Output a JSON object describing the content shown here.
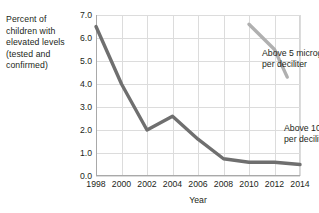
{
  "chart_data": {
    "type": "line",
    "title": "",
    "xlabel": "Year",
    "ylabel": "Percent of children with elevated levels (tested and confirmed)",
    "ylabel_lines": [
      "Percent of",
      "children with",
      "elevated levels",
      "(tested and",
      "confirmed)"
    ],
    "x": [
      1998,
      2000,
      2002,
      2004,
      2006,
      2008,
      2010,
      2012,
      2014
    ],
    "xlim": [
      1998,
      2014
    ],
    "ylim": [
      0.0,
      7.0
    ],
    "xtick_labels": [
      "1998",
      "2000",
      "2002",
      "2004",
      "2006",
      "2008",
      "2010",
      "2012",
      "2014"
    ],
    "ytick_labels": [
      "0.0",
      "1.0",
      "2.0",
      "3.0",
      "4.0",
      "5.0",
      "6.0",
      "7.0"
    ],
    "ytick_values": [
      0.0,
      1.0,
      2.0,
      3.0,
      4.0,
      5.0,
      6.0,
      7.0
    ],
    "grid": true,
    "legend": "annotations-inline",
    "series": [
      {
        "name": "Above 10 micrograms per deciliter",
        "color": "#6f6f6f",
        "label_lines": [
          "Above 10 micrograms",
          "per deciliter"
        ],
        "x": [
          1998,
          2000,
          2002,
          2004,
          2006,
          2008,
          2010,
          2012,
          2014
        ],
        "values": [
          6.5,
          4.0,
          2.0,
          2.6,
          1.6,
          0.75,
          0.6,
          0.6,
          0.5
        ]
      },
      {
        "name": "Above 5 micrograms per deciliter",
        "color": "#b0b0b0",
        "label_lines": [
          "Above 5 micrograms",
          "per deciliter"
        ],
        "x": [
          2010,
          2012,
          2013
        ],
        "values": [
          6.6,
          5.5,
          4.3
        ]
      }
    ]
  },
  "colors": {
    "series_10ug": "#6f6f6f",
    "series_5ug": "#b0b0b0",
    "gridline": "#dcdcdc",
    "axis": "#a9a9a9",
    "text": "#231f20",
    "background": "#ffffff"
  }
}
